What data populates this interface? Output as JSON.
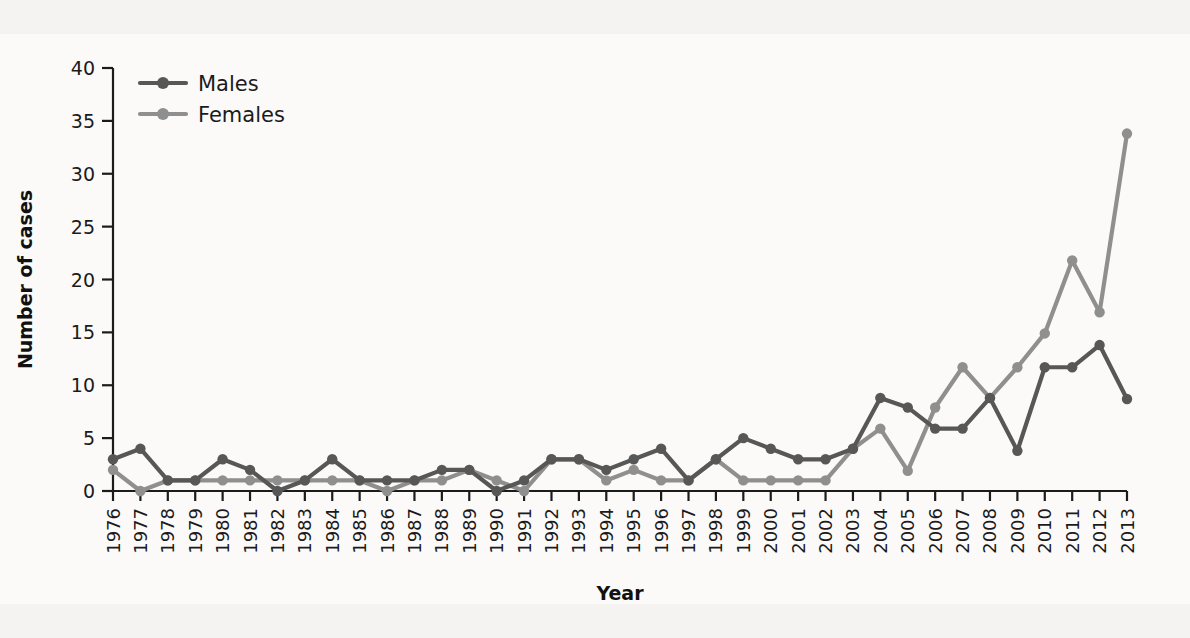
{
  "figure": {
    "background_color": "#f4f3f1",
    "plot_background_color": "#fbfaf9"
  },
  "chart_data": {
    "type": "line",
    "title": "",
    "xlabel": "Year",
    "ylabel": "Number of cases",
    "xlim": [
      1976,
      2013
    ],
    "ylim": [
      0,
      40
    ],
    "yticks": [
      0,
      5,
      10,
      15,
      20,
      25,
      30,
      35,
      40
    ],
    "grid": false,
    "legend_position": "top-left",
    "categories": [
      "1976",
      "1977",
      "1978",
      "1979",
      "1980",
      "1981",
      "1982",
      "1983",
      "1984",
      "1985",
      "1986",
      "1987",
      "1988",
      "1989",
      "1990",
      "1991",
      "1992",
      "1993",
      "1994",
      "1995",
      "1996",
      "1997",
      "1998",
      "1999",
      "2000",
      "2001",
      "2002",
      "2003",
      "2004",
      "2005",
      "2006",
      "2007",
      "2008",
      "2009",
      "2010",
      "2011",
      "2012",
      "2013"
    ],
    "series": [
      {
        "name": "Males",
        "color": "#575757",
        "values": [
          3.0,
          4.0,
          1.0,
          1.0,
          3.0,
          2.0,
          0.0,
          1.0,
          3.0,
          1.0,
          1.0,
          1.0,
          2.0,
          2.0,
          0.0,
          1.0,
          3.0,
          3.0,
          2.0,
          3.0,
          4.0,
          1.0,
          3.0,
          5.0,
          4.0,
          3.0,
          3.0,
          4.0,
          8.8,
          7.9,
          5.9,
          5.9,
          8.8,
          3.8,
          11.7,
          11.7,
          13.8,
          8.7
        ]
      },
      {
        "name": "Females",
        "color": "#8f8f8f",
        "values": [
          2.0,
          0.0,
          1.0,
          1.0,
          1.0,
          1.0,
          1.0,
          1.0,
          1.0,
          1.0,
          0.0,
          1.0,
          1.0,
          2.0,
          1.0,
          0.0,
          3.0,
          3.0,
          1.0,
          2.0,
          1.0,
          1.0,
          3.0,
          1.0,
          1.0,
          1.0,
          1.0,
          4.0,
          5.9,
          1.9,
          7.9,
          11.7,
          8.8,
          11.7,
          14.9,
          21.8,
          16.9,
          33.8
        ]
      }
    ]
  },
  "legend": {
    "entries": [
      {
        "label": "Males",
        "color": "#575757"
      },
      {
        "label": "Females",
        "color": "#8f8f8f"
      }
    ]
  },
  "axes": {
    "y_title": "Number of cases",
    "x_title": "Year"
  }
}
